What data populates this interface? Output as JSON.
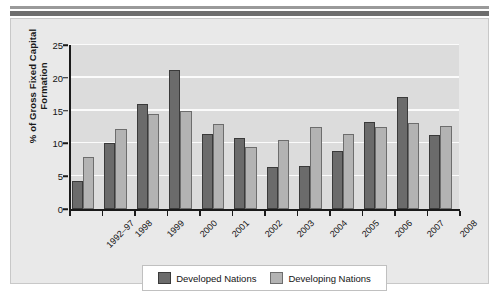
{
  "chart_data": {
    "type": "bar",
    "title": "",
    "xlabel": "",
    "ylabel": "% of Gross Fixed Capital Formation",
    "ylabel_lines": [
      "% of Gross Fixed Capital",
      "Formation"
    ],
    "ylim": [
      0,
      25
    ],
    "yticks": [
      0,
      5,
      10,
      15,
      20,
      25
    ],
    "grid": true,
    "grid_axis": "y",
    "legend_position": "bottom",
    "categories": [
      "1992–97",
      "1998",
      "1999",
      "2000",
      "2001",
      "2002",
      "2003",
      "2004",
      "2005",
      "2006",
      "2007",
      "2008"
    ],
    "series": [
      {
        "name": "Developed Nations",
        "color": "#6b6b6b",
        "values": [
          4.2,
          10.0,
          16.0,
          21.2,
          11.4,
          10.9,
          6.4,
          6.6,
          8.9,
          13.3,
          17.0,
          11.3
        ]
      },
      {
        "name": "Developing Nations",
        "color": "#b3b3b3",
        "values": [
          7.9,
          12.2,
          14.5,
          15.0,
          13.0,
          9.4,
          10.5,
          12.5,
          11.4,
          12.5,
          13.1,
          12.7
        ]
      }
    ]
  },
  "legend": {
    "entries": [
      {
        "label": "Developed Nations"
      },
      {
        "label": "Developing Nations"
      }
    ]
  }
}
